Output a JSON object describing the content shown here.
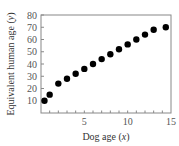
{
  "chart_data": {
    "type": "scatter",
    "title": "",
    "xlabel": "Dog age (x)",
    "ylabel": "Equivalent human age (y)",
    "xlim": [
      0,
      15
    ],
    "ylim": [
      0,
      80
    ],
    "x_ticks": [
      5,
      10,
      15
    ],
    "x_minor_ticks": [
      1,
      2,
      3,
      4,
      5,
      6,
      7,
      8,
      9,
      10,
      11,
      12,
      13,
      14
    ],
    "y_ticks": [
      10,
      20,
      30,
      40,
      50,
      60,
      70,
      80
    ],
    "grid": false,
    "legend": null,
    "marker_color": "#000000",
    "series": [
      {
        "name": "points",
        "x": [
          0.4,
          1,
          2,
          3,
          4,
          5,
          6,
          7,
          8,
          9,
          10,
          11,
          12,
          13,
          14.4
        ],
        "y": [
          10,
          15,
          24,
          28,
          32,
          36,
          40,
          44,
          48,
          52,
          56,
          60,
          64,
          68,
          70
        ]
      }
    ]
  },
  "labels": {
    "xlabel_main": "Dog age (",
    "xlabel_var": "x",
    "xlabel_end": ")",
    "ylabel_main": "Equivalent human age (",
    "ylabel_var": "y",
    "ylabel_end": ")"
  }
}
